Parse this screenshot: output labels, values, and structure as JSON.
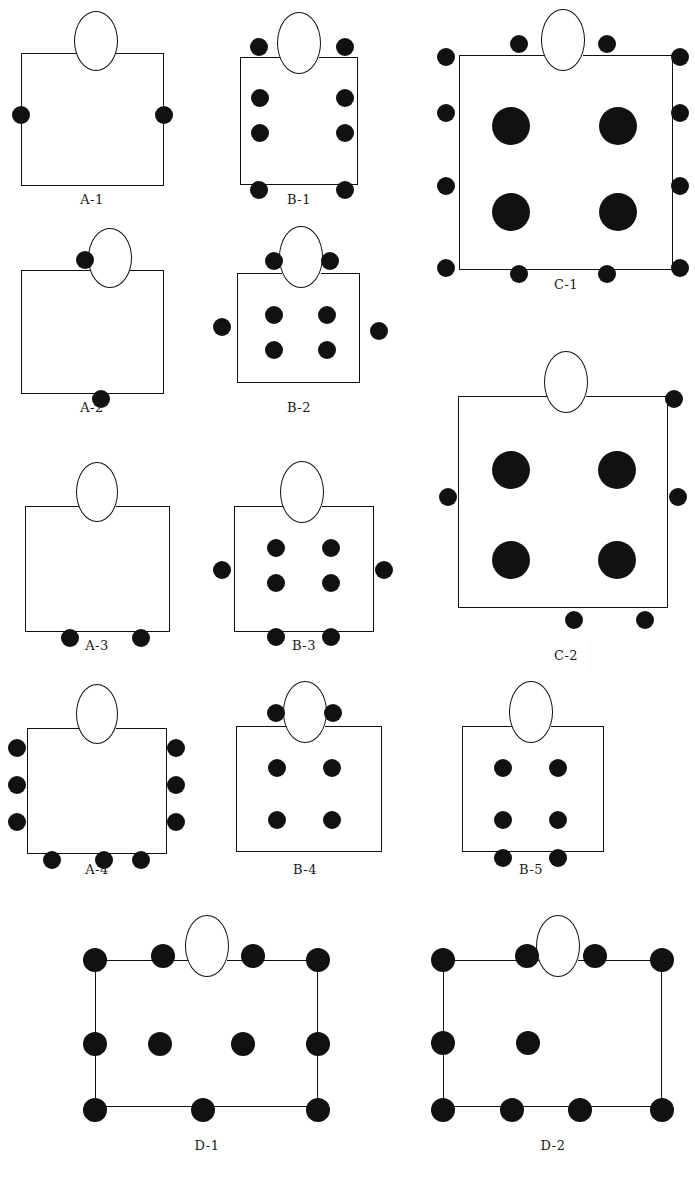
{
  "figure": {
    "width": 695,
    "height": 1184,
    "background_color": "#ffffff",
    "seat_color": "#111111",
    "line_color": "#111111",
    "table_fill": "#ffffff"
  },
  "legend_notes": {
    "table_shape": "rectangle",
    "head_seat_shape": "ellipse-outline",
    "occupied_seat_shape": "filled-circle"
  },
  "diagrams": [
    {
      "id": "A-1",
      "label": "A-1",
      "box": {
        "x": 21,
        "y": 53,
        "w": 143,
        "h": 133
      },
      "oval": {
        "cx": 96,
        "cy": 41,
        "rx": 22,
        "ry": 30
      },
      "label_pos": {
        "cx": 92,
        "y": 192
      },
      "seat_radius": 9,
      "seat_count": 2,
      "seats": [
        {
          "x": 21,
          "y": 115
        },
        {
          "x": 164,
          "y": 115
        }
      ]
    },
    {
      "id": "B-1",
      "label": "B-1",
      "box": {
        "x": 240,
        "y": 57,
        "w": 118,
        "h": 128
      },
      "oval": {
        "cx": 299,
        "cy": 43,
        "rx": 22,
        "ry": 31
      },
      "label_pos": {
        "cx": 299,
        "y": 192
      },
      "seat_radius": 9,
      "seat_count": 8,
      "seats": [
        {
          "x": 259,
          "y": 47
        },
        {
          "x": 345,
          "y": 47
        },
        {
          "x": 260,
          "y": 98
        },
        {
          "x": 345,
          "y": 98
        },
        {
          "x": 260,
          "y": 133
        },
        {
          "x": 345,
          "y": 133
        },
        {
          "x": 259,
          "y": 190
        },
        {
          "x": 345,
          "y": 190
        }
      ]
    },
    {
      "id": "C-1",
      "label": "C-1",
      "box": {
        "x": 459,
        "y": 55,
        "w": 214,
        "h": 215
      },
      "oval": {
        "cx": 563,
        "cy": 40,
        "rx": 22,
        "ry": 31
      },
      "label_pos": {
        "cx": 566,
        "y": 277
      },
      "seat_radius": 9,
      "big_seat_radius": 19,
      "seat_count": 16,
      "seats": [
        {
          "x": 519,
          "y": 44
        },
        {
          "x": 607,
          "y": 44
        },
        {
          "x": 446,
          "y": 57
        },
        {
          "x": 680,
          "y": 57
        },
        {
          "x": 446,
          "y": 113
        },
        {
          "x": 680,
          "y": 113
        },
        {
          "x": 446,
          "y": 186
        },
        {
          "x": 680,
          "y": 186
        },
        {
          "x": 446,
          "y": 268
        },
        {
          "x": 680,
          "y": 268
        },
        {
          "x": 519,
          "y": 274
        },
        {
          "x": 607,
          "y": 274
        }
      ],
      "big_seats": [
        {
          "x": 511,
          "y": 126
        },
        {
          "x": 618,
          "y": 126
        },
        {
          "x": 511,
          "y": 212
        },
        {
          "x": 618,
          "y": 212
        }
      ]
    },
    {
      "id": "A-2",
      "label": "A-2",
      "box": {
        "x": 21,
        "y": 270,
        "w": 143,
        "h": 124
      },
      "oval": {
        "cx": 110,
        "cy": 258,
        "rx": 22,
        "ry": 30
      },
      "label_pos": {
        "cx": 92,
        "y": 400
      },
      "seat_radius": 9,
      "seat_count": 2,
      "seats": [
        {
          "x": 85,
          "y": 260
        },
        {
          "x": 101,
          "y": 399
        }
      ]
    },
    {
      "id": "B-2",
      "label": "B-2",
      "box": {
        "x": 237,
        "y": 273,
        "w": 123,
        "h": 110
      },
      "oval": {
        "cx": 301,
        "cy": 257,
        "rx": 22,
        "ry": 31
      },
      "label_pos": {
        "cx": 299,
        "y": 400
      },
      "seat_radius": 9,
      "seat_count": 8,
      "seats": [
        {
          "x": 274,
          "y": 261
        },
        {
          "x": 330,
          "y": 261
        },
        {
          "x": 222,
          "y": 327
        },
        {
          "x": 379,
          "y": 331
        },
        {
          "x": 274,
          "y": 315
        },
        {
          "x": 327,
          "y": 315
        },
        {
          "x": 274,
          "y": 350
        },
        {
          "x": 327,
          "y": 350
        }
      ]
    },
    {
      "id": "A-3",
      "label": "A-3",
      "box": {
        "x": 25,
        "y": 506,
        "w": 145,
        "h": 126
      },
      "oval": {
        "cx": 97,
        "cy": 492,
        "rx": 21,
        "ry": 30
      },
      "label_pos": {
        "cx": 97,
        "y": 638
      },
      "seat_radius": 9,
      "seat_count": 2,
      "seats": [
        {
          "x": 70,
          "y": 638
        },
        {
          "x": 141,
          "y": 638
        }
      ]
    },
    {
      "id": "B-3",
      "label": "B-3",
      "box": {
        "x": 234,
        "y": 506,
        "w": 140,
        "h": 126
      },
      "oval": {
        "cx": 302,
        "cy": 492,
        "rx": 22,
        "ry": 31
      },
      "label_pos": {
        "cx": 304,
        "y": 638
      },
      "seat_radius": 9,
      "seat_count": 8,
      "seats": [
        {
          "x": 222,
          "y": 570
        },
        {
          "x": 384,
          "y": 570
        },
        {
          "x": 276,
          "y": 548
        },
        {
          "x": 331,
          "y": 548
        },
        {
          "x": 276,
          "y": 583
        },
        {
          "x": 331,
          "y": 583
        },
        {
          "x": 276,
          "y": 637
        },
        {
          "x": 331,
          "y": 637
        }
      ]
    },
    {
      "id": "C-2",
      "label": "C-2",
      "box": {
        "x": 458,
        "y": 396,
        "w": 210,
        "h": 212
      },
      "oval": {
        "cx": 566,
        "cy": 382,
        "rx": 22,
        "ry": 31
      },
      "label_pos": {
        "cx": 566,
        "y": 648
      },
      "seat_radius": 9,
      "big_seat_radius": 19,
      "seat_count": 9,
      "seats": [
        {
          "x": 674,
          "y": 399
        },
        {
          "x": 448,
          "y": 497
        },
        {
          "x": 678,
          "y": 497
        },
        {
          "x": 574,
          "y": 620
        },
        {
          "x": 645,
          "y": 620
        }
      ],
      "big_seats": [
        {
          "x": 511,
          "y": 470
        },
        {
          "x": 617,
          "y": 470
        },
        {
          "x": 511,
          "y": 560
        },
        {
          "x": 617,
          "y": 560
        }
      ]
    },
    {
      "id": "A-4",
      "label": "A-4",
      "box": {
        "x": 27,
        "y": 728,
        "w": 140,
        "h": 126
      },
      "oval": {
        "cx": 97,
        "cy": 714,
        "rx": 21,
        "ry": 30
      },
      "label_pos": {
        "cx": 97,
        "y": 862
      },
      "seat_radius": 9,
      "seat_count": 9,
      "seats": [
        {
          "x": 17,
          "y": 748
        },
        {
          "x": 17,
          "y": 785
        },
        {
          "x": 17,
          "y": 822
        },
        {
          "x": 176,
          "y": 748
        },
        {
          "x": 176,
          "y": 785
        },
        {
          "x": 176,
          "y": 822
        },
        {
          "x": 52,
          "y": 860
        },
        {
          "x": 104,
          "y": 860
        },
        {
          "x": 141,
          "y": 860
        }
      ]
    },
    {
      "id": "B-4",
      "label": "B-4",
      "box": {
        "x": 236,
        "y": 726,
        "w": 146,
        "h": 126
      },
      "oval": {
        "cx": 305,
        "cy": 712,
        "rx": 22,
        "ry": 31
      },
      "label_pos": {
        "cx": 305,
        "y": 862
      },
      "seat_radius": 9,
      "seat_count": 6,
      "seats": [
        {
          "x": 276,
          "y": 713
        },
        {
          "x": 333,
          "y": 713
        },
        {
          "x": 277,
          "y": 768
        },
        {
          "x": 332,
          "y": 768
        },
        {
          "x": 277,
          "y": 820
        },
        {
          "x": 332,
          "y": 820
        }
      ]
    },
    {
      "id": "B-5",
      "label": "B-5",
      "box": {
        "x": 462,
        "y": 726,
        "w": 142,
        "h": 126
      },
      "oval": {
        "cx": 531,
        "cy": 712,
        "rx": 22,
        "ry": 31
      },
      "label_pos": {
        "cx": 531,
        "y": 862
      },
      "seat_radius": 9,
      "seat_count": 6,
      "seats": [
        {
          "x": 503,
          "y": 768
        },
        {
          "x": 558,
          "y": 768
        },
        {
          "x": 503,
          "y": 820
        },
        {
          "x": 558,
          "y": 820
        },
        {
          "x": 503,
          "y": 858
        },
        {
          "x": 558,
          "y": 858
        }
      ]
    },
    {
      "id": "D-1",
      "label": "D-1",
      "box": {
        "x": 95,
        "y": 960,
        "w": 223,
        "h": 147
      },
      "oval": {
        "cx": 207,
        "cy": 946,
        "rx": 22,
        "ry": 31
      },
      "label_pos": {
        "cx": 207,
        "y": 1138
      },
      "seat_radius": 12,
      "seat_count": 11,
      "seats": [
        {
          "x": 95,
          "y": 960
        },
        {
          "x": 163,
          "y": 956
        },
        {
          "x": 253,
          "y": 956
        },
        {
          "x": 318,
          "y": 960
        },
        {
          "x": 95,
          "y": 1044
        },
        {
          "x": 160,
          "y": 1044
        },
        {
          "x": 243,
          "y": 1044
        },
        {
          "x": 318,
          "y": 1044
        },
        {
          "x": 95,
          "y": 1110
        },
        {
          "x": 203,
          "y": 1110
        },
        {
          "x": 318,
          "y": 1110
        }
      ]
    },
    {
      "id": "D-2",
      "label": "D-2",
      "box": {
        "x": 443,
        "y": 960,
        "w": 219,
        "h": 147
      },
      "oval": {
        "cx": 558,
        "cy": 946,
        "rx": 22,
        "ry": 31
      },
      "label_pos": {
        "cx": 553,
        "y": 1138
      },
      "seat_radius": 12,
      "seat_count": 10,
      "seats": [
        {
          "x": 443,
          "y": 960
        },
        {
          "x": 527,
          "y": 956
        },
        {
          "x": 595,
          "y": 956
        },
        {
          "x": 662,
          "y": 960
        },
        {
          "x": 443,
          "y": 1043
        },
        {
          "x": 528,
          "y": 1043
        },
        {
          "x": 443,
          "y": 1110
        },
        {
          "x": 512,
          "y": 1110
        },
        {
          "x": 580,
          "y": 1110
        },
        {
          "x": 662,
          "y": 1110
        }
      ]
    }
  ]
}
